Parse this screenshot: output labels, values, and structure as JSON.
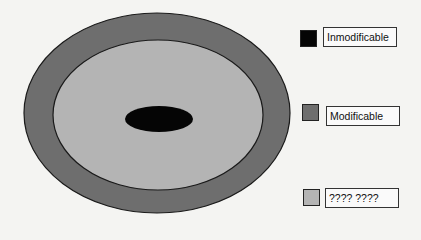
{
  "diagram": {
    "layers": [
      {
        "name": "outer-ring",
        "color": "#6e6e6e",
        "cx": 157,
        "cy": 113,
        "rx": 133,
        "ry": 100
      },
      {
        "name": "middle-area",
        "color": "#b4b4b4",
        "cx": 158,
        "cy": 115,
        "rx": 105,
        "ry": 75
      },
      {
        "name": "core",
        "color": "#050505",
        "cx": 159,
        "cy": 119,
        "rx": 34,
        "ry": 13
      }
    ]
  },
  "legend": {
    "items": [
      {
        "label": "Inmodificable",
        "color": "#050505"
      },
      {
        "label": "Modificable",
        "color": "#6e6e6e"
      },
      {
        "label": "???? ????",
        "color": "#b4b4b4"
      }
    ]
  }
}
